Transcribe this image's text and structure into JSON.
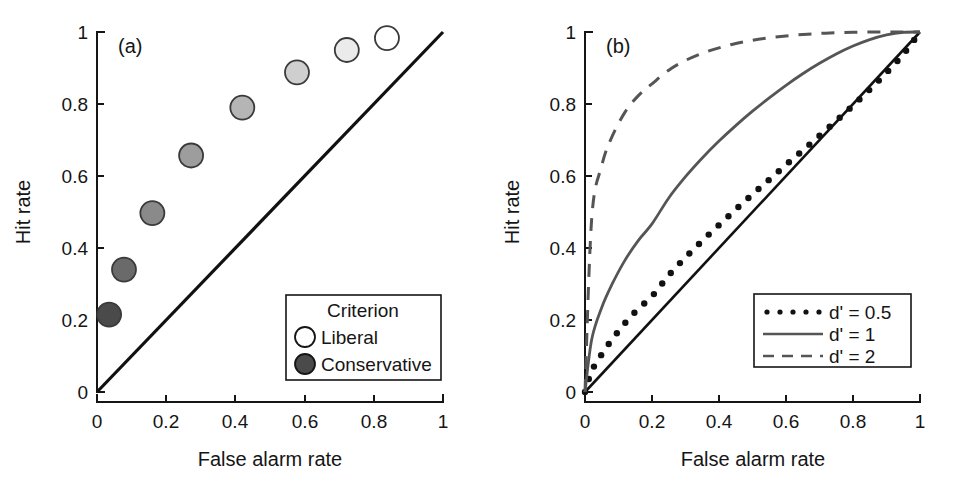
{
  "figure": {
    "background": "#ffffff",
    "width": 954,
    "height": 494
  },
  "panel_a": {
    "tag": "(a)",
    "xlabel": "False alarm rate",
    "ylabel": "Hit rate",
    "xticks": [
      "0",
      "0.2",
      "0.4",
      "0.6",
      "0.8",
      "1"
    ],
    "yticks": [
      "0",
      "0.2",
      "0.4",
      "0.6",
      "0.8",
      "1"
    ],
    "legend": {
      "title": "Criterion",
      "items": [
        {
          "label": "Liberal",
          "marker": "open-circle",
          "fill": "#ffffff"
        },
        {
          "label": "Conservative",
          "marker": "filled-circle",
          "fill": "#4a4a4a"
        }
      ]
    }
  },
  "panel_b": {
    "tag": "(b)",
    "xlabel": "False alarm rate",
    "ylabel": "Hit rate",
    "xticks": [
      "0",
      "0.2",
      "0.4",
      "0.6",
      "0.8",
      "1"
    ],
    "yticks": [
      "0",
      "0.2",
      "0.4",
      "0.6",
      "0.8",
      "1"
    ],
    "legend": {
      "items": [
        {
          "label": "d' = 0.5",
          "style": "dotted",
          "color": "#111111"
        },
        {
          "label": "d' = 1",
          "style": "solid",
          "color": "#555555"
        },
        {
          "label": "d' = 2",
          "style": "dashed",
          "color": "#555555"
        }
      ]
    }
  },
  "chart_data": [
    {
      "type": "scatter",
      "title": "(a)",
      "xlabel": "False alarm rate",
      "ylabel": "Hit rate",
      "xlim": [
        0,
        1
      ],
      "ylim": [
        0,
        1
      ],
      "xticks": [
        0,
        0.2,
        0.4,
        0.6,
        0.8,
        1
      ],
      "yticks": [
        0,
        0.2,
        0.4,
        0.6,
        0.8,
        1
      ],
      "grid": false,
      "legend_position": "lower-right",
      "legend_title": "Criterion",
      "series": [
        {
          "name": "ROC points (criterion sweep, conservative to liberal)",
          "marker": "circle",
          "points": [
            {
              "x": 0.035,
              "y": 0.215,
              "fill": "#4a4a4a"
            },
            {
              "x": 0.078,
              "y": 0.34,
              "fill": "#6a6a6a"
            },
            {
              "x": 0.16,
              "y": 0.497,
              "fill": "#8a8a8a"
            },
            {
              "x": 0.272,
              "y": 0.657,
              "fill": "#9d9d9d"
            },
            {
              "x": 0.42,
              "y": 0.79,
              "fill": "#b5b5b5"
            },
            {
              "x": 0.578,
              "y": 0.888,
              "fill": "#cfcfcf"
            },
            {
              "x": 0.722,
              "y": 0.95,
              "fill": "#ebebeb"
            },
            {
              "x": 0.838,
              "y": 0.983,
              "fill": "#ffffff"
            }
          ]
        },
        {
          "name": "chance diagonal",
          "style": "solid",
          "color": "#111111",
          "x": [
            0,
            1
          ],
          "y": [
            0,
            1
          ]
        }
      ]
    },
    {
      "type": "line",
      "title": "(b)",
      "xlabel": "False alarm rate",
      "ylabel": "Hit rate",
      "xlim": [
        0,
        1
      ],
      "ylim": [
        0,
        1
      ],
      "xticks": [
        0,
        0.2,
        0.4,
        0.6,
        0.8,
        1
      ],
      "yticks": [
        0,
        0.2,
        0.4,
        0.6,
        0.8,
        1
      ],
      "grid": false,
      "legend_position": "lower-right",
      "x": [
        0,
        0.02,
        0.05,
        0.08,
        0.12,
        0.16,
        0.2,
        0.25,
        0.3,
        0.35,
        0.4,
        0.45,
        0.5,
        0.55,
        0.6,
        0.65,
        0.7,
        0.75,
        0.8,
        0.85,
        0.9,
        0.95,
        1
      ],
      "series": [
        {
          "name": "d' = 0.5",
          "style": "dotted",
          "color": "#111111",
          "values": [
            0,
            0.058,
            0.105,
            0.145,
            0.192,
            0.232,
            0.266,
            0.324,
            0.374,
            0.42,
            0.464,
            0.507,
            0.549,
            0.59,
            0.631,
            0.671,
            0.712,
            0.753,
            0.796,
            0.84,
            0.887,
            0.938,
            1
          ]
        },
        {
          "name": "d' = 1",
          "style": "solid",
          "color": "#555555",
          "values": [
            0,
            0.146,
            0.235,
            0.298,
            0.367,
            0.422,
            0.467,
            0.539,
            0.598,
            0.65,
            0.697,
            0.74,
            0.78,
            0.817,
            0.852,
            0.884,
            0.913,
            0.939,
            0.961,
            0.979,
            0.992,
            0.999,
            1
          ]
        },
        {
          "name": "d' = 2",
          "style": "dashed",
          "color": "#555555",
          "values": [
            0,
            0.482,
            0.629,
            0.708,
            0.778,
            0.824,
            0.856,
            0.894,
            0.921,
            0.941,
            0.956,
            0.968,
            0.977,
            0.984,
            0.989,
            0.993,
            0.996,
            0.998,
            0.999,
            1.0,
            1.0,
            1.0,
            1
          ]
        },
        {
          "name": "chance diagonal",
          "style": "solid",
          "color": "#111111",
          "x": [
            0,
            1
          ],
          "y": [
            0,
            1
          ]
        }
      ]
    }
  ]
}
